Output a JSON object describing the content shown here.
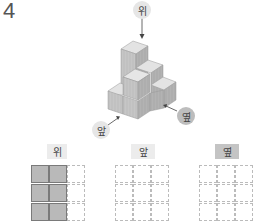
{
  "question_number": "4",
  "figure": {
    "arrow_labels": {
      "top": "위",
      "front": "앞",
      "side": "옆"
    },
    "cube_color": "#c9c9c9"
  },
  "views": [
    {
      "label": "위",
      "highlighted": false,
      "filled_cells": [
        [
          0,
          0
        ],
        [
          0,
          1
        ],
        [
          1,
          0
        ],
        [
          1,
          1
        ],
        [
          2,
          0
        ],
        [
          2,
          1
        ]
      ]
    },
    {
      "label": "앞",
      "highlighted": false,
      "filled_cells": []
    },
    {
      "label": "옆",
      "highlighted": true,
      "filled_cells": []
    }
  ],
  "grid": {
    "rows": 3,
    "cols": 3
  }
}
